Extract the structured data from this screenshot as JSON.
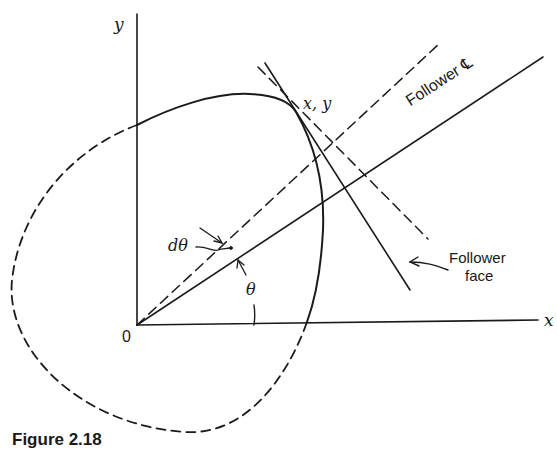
{
  "figure": {
    "caption": "Figure 2.18",
    "labels": {
      "y_axis": "y",
      "x_axis": "x",
      "origin": "0",
      "contact_point": "x, y",
      "follower_centerline": "Follower ℄",
      "d_theta": "dθ",
      "theta": "θ",
      "follower_face_line1": "Follower",
      "follower_face_line2": "face"
    },
    "colors": {
      "ink": "#1a1a1a",
      "background": "#ffffff"
    }
  }
}
